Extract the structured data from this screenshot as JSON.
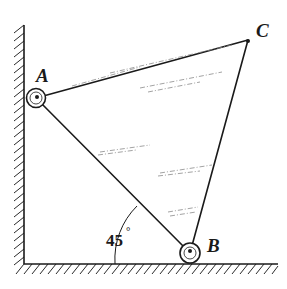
{
  "diagram": {
    "type": "statics-rigid-body",
    "labels": {
      "A": "A",
      "B": "B",
      "C": "C",
      "angle": "45",
      "degree": "°"
    },
    "points": {
      "A": [
        36,
        98
      ],
      "B": [
        190,
        253
      ],
      "C": [
        248,
        40
      ]
    },
    "wall": {
      "x": 24,
      "y_top": 25,
      "y_bottom": 264
    },
    "floor": {
      "y": 264,
      "x_left": 24,
      "x_right": 278
    },
    "angle_annotation": {
      "vertex": "B",
      "between": [
        "AB",
        "floor"
      ],
      "value_deg": 45
    },
    "colors": {
      "ink": "#1a1a1a",
      "background": "#ffffff",
      "shading": "#8a8a8a"
    }
  }
}
